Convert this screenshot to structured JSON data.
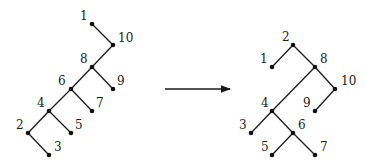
{
  "diagram": {
    "left_tree": {
      "nodes": [
        {
          "id": "1",
          "x": 92,
          "y": 24,
          "lx": 80,
          "ly": 20
        },
        {
          "id": "10",
          "x": 113,
          "y": 45,
          "lx": 118,
          "ly": 42
        },
        {
          "id": "8",
          "x": 92,
          "y": 67,
          "lx": 80,
          "ly": 63
        },
        {
          "id": "9",
          "x": 113,
          "y": 89,
          "lx": 117,
          "ly": 85
        },
        {
          "id": "6",
          "x": 71,
          "y": 89,
          "lx": 58,
          "ly": 85
        },
        {
          "id": "7",
          "x": 92,
          "y": 111,
          "lx": 96,
          "ly": 107
        },
        {
          "id": "4",
          "x": 49,
          "y": 111,
          "lx": 37,
          "ly": 107
        },
        {
          "id": "5",
          "x": 71,
          "y": 133,
          "lx": 75,
          "ly": 129
        },
        {
          "id": "2",
          "x": 28,
          "y": 133,
          "lx": 16,
          "ly": 129
        },
        {
          "id": "3",
          "x": 49,
          "y": 155,
          "lx": 54,
          "ly": 151
        }
      ],
      "edges": [
        [
          "1",
          "10"
        ],
        [
          "10",
          "8"
        ],
        [
          "8",
          "9"
        ],
        [
          "8",
          "6"
        ],
        [
          "6",
          "7"
        ],
        [
          "6",
          "4"
        ],
        [
          "4",
          "5"
        ],
        [
          "4",
          "2"
        ],
        [
          "2",
          "3"
        ]
      ]
    },
    "arrow": {
      "x1": 165,
      "y1": 89,
      "x2": 230,
      "y2": 89
    },
    "right_tree": {
      "nodes": [
        {
          "id": "2",
          "x": 293,
          "y": 45,
          "lx": 282,
          "ly": 41
        },
        {
          "id": "1",
          "x": 272,
          "y": 67,
          "lx": 260,
          "ly": 63
        },
        {
          "id": "8",
          "x": 315,
          "y": 67,
          "lx": 320,
          "ly": 63
        },
        {
          "id": "10",
          "x": 335,
          "y": 89,
          "lx": 341,
          "ly": 85
        },
        {
          "id": "9",
          "x": 315,
          "y": 111,
          "lx": 303,
          "ly": 107
        },
        {
          "id": "4",
          "x": 272,
          "y": 111,
          "lx": 261,
          "ly": 107
        },
        {
          "id": "3",
          "x": 251,
          "y": 133,
          "lx": 239,
          "ly": 129
        },
        {
          "id": "6",
          "x": 293,
          "y": 133,
          "lx": 298,
          "ly": 129
        },
        {
          "id": "5",
          "x": 272,
          "y": 155,
          "lx": 261,
          "ly": 151
        },
        {
          "id": "7",
          "x": 315,
          "y": 155,
          "lx": 320,
          "ly": 151
        }
      ],
      "edges": [
        [
          "2",
          "1"
        ],
        [
          "2",
          "8"
        ],
        [
          "8",
          "10"
        ],
        [
          "10",
          "9"
        ],
        [
          "8",
          "4"
        ],
        [
          "4",
          "3"
        ],
        [
          "4",
          "6"
        ],
        [
          "6",
          "5"
        ],
        [
          "6",
          "7"
        ]
      ]
    }
  }
}
